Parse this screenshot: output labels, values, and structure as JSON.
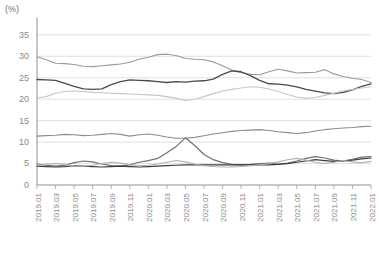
{
  "axis_unit_label": "(%)",
  "chart_data": {
    "type": "line",
    "title": "",
    "subtitle": "",
    "xlabel": "",
    "ylabel": "(%)",
    "ylim": [
      0,
      38
    ],
    "yticks": [
      0,
      5,
      10,
      15,
      20,
      25,
      30,
      35
    ],
    "grid": true,
    "legend_position": "none",
    "annotations": [],
    "x": [
      "2019.01",
      "2019.02",
      "2019.03",
      "2019.04",
      "2019.05",
      "2019.06",
      "2019.07",
      "2019.08",
      "2019.09",
      "2019.10",
      "2019.11",
      "2019.12",
      "2020.01",
      "2020.02",
      "2020.03",
      "2020.04",
      "2020.05",
      "2020.06",
      "2020.07",
      "2020.08",
      "2020.09",
      "2020.10",
      "2020.11",
      "2020.12",
      "2021.01",
      "2021.02",
      "2021.03",
      "2021.04",
      "2021.05",
      "2021.06",
      "2021.07",
      "2021.08",
      "2021.09",
      "2021.10",
      "2021.11",
      "2021.12",
      "2022.01"
    ],
    "tick_labels": [
      "2019.01",
      "2019.03",
      "2019.05",
      "2019.07",
      "2019.09",
      "2019.11",
      "2020.01",
      "2020.03",
      "2020.05",
      "2020.07",
      "2020.09",
      "2020.11",
      "2021.01",
      "2021.03",
      "2021.05",
      "2021.07",
      "2021.09",
      "2021.11",
      "2022.01"
    ],
    "tick_indices": [
      0,
      2,
      4,
      6,
      8,
      10,
      12,
      14,
      16,
      18,
      20,
      22,
      24,
      26,
      28,
      30,
      32,
      34,
      36
    ],
    "series": [
      {
        "name": "series-1",
        "color": "#9a9a9a",
        "width": 1.1,
        "values": [
          29.9,
          29.2,
          28.4,
          28.3,
          28.1,
          27.7,
          27.6,
          27.8,
          28.0,
          28.2,
          28.6,
          29.3,
          29.8,
          30.4,
          30.5,
          30.2,
          29.5,
          29.3,
          29.2,
          28.7,
          27.8,
          26.8,
          26.2,
          25.8,
          25.7,
          26.4,
          27.0,
          26.6,
          26.1,
          26.2,
          26.3,
          26.9,
          25.9,
          25.3,
          24.9,
          24.6,
          23.9
        ]
      },
      {
        "name": "series-2",
        "color": "#4a4a4a",
        "width": 1.3,
        "values": [
          24.6,
          24.5,
          24.4,
          23.7,
          23.0,
          22.4,
          22.3,
          22.4,
          23.4,
          24.1,
          24.5,
          24.4,
          24.3,
          24.1,
          23.9,
          24.1,
          24.0,
          24.2,
          24.3,
          24.7,
          25.8,
          26.6,
          26.4,
          25.5,
          24.4,
          23.6,
          23.5,
          23.3,
          22.9,
          22.3,
          21.9,
          21.5,
          21.3,
          21.6,
          22.2,
          23.0,
          23.6
        ]
      },
      {
        "name": "series-3",
        "color": "#c6c6c6",
        "width": 1.1,
        "values": [
          20.3,
          20.6,
          21.4,
          21.8,
          21.9,
          21.8,
          21.6,
          21.5,
          21.4,
          21.3,
          21.2,
          21.1,
          21.0,
          20.9,
          20.6,
          20.2,
          19.7,
          20.0,
          20.6,
          21.3,
          21.9,
          22.3,
          22.6,
          22.9,
          22.8,
          22.4,
          21.8,
          21.1,
          20.5,
          20.2,
          20.4,
          20.9,
          21.4,
          21.9,
          22.3,
          22.6,
          22.9
        ]
      },
      {
        "name": "series-4",
        "color": "#8c8c8c",
        "width": 1.1,
        "values": [
          11.4,
          11.5,
          11.6,
          11.8,
          11.7,
          11.5,
          11.6,
          11.8,
          12.0,
          11.8,
          11.4,
          11.7,
          11.9,
          11.6,
          11.2,
          10.9,
          10.9,
          11.1,
          11.5,
          11.9,
          12.2,
          12.5,
          12.7,
          12.8,
          12.9,
          12.7,
          12.4,
          12.2,
          12.0,
          12.2,
          12.6,
          12.9,
          13.1,
          13.3,
          13.4,
          13.6,
          13.7
        ]
      },
      {
        "name": "series-5",
        "color": "#707070",
        "width": 1.2,
        "values": [
          4.9,
          4.6,
          4.4,
          4.6,
          5.2,
          5.6,
          5.4,
          4.9,
          4.5,
          4.4,
          4.7,
          5.3,
          5.7,
          6.2,
          7.5,
          9.0,
          11.0,
          9.2,
          7.1,
          5.9,
          5.2,
          4.8,
          4.7,
          4.8,
          5.0,
          5.1,
          4.9,
          5.1,
          5.6,
          6.2,
          6.6,
          6.3,
          5.8,
          5.6,
          6.0,
          6.5,
          6.6
        ]
      },
      {
        "name": "series-6",
        "color": "#3c3c3c",
        "width": 1.2,
        "values": [
          4.4,
          4.3,
          4.2,
          4.3,
          4.5,
          4.4,
          4.3,
          4.2,
          4.3,
          4.4,
          4.3,
          4.2,
          4.3,
          4.4,
          4.5,
          4.6,
          4.7,
          4.7,
          4.7,
          4.7,
          4.7,
          4.7,
          4.7,
          4.7,
          4.7,
          4.7,
          4.8,
          5.0,
          5.3,
          5.6,
          5.9,
          5.7,
          5.5,
          5.6,
          5.8,
          6.1,
          6.3
        ]
      },
      {
        "name": "series-7",
        "color": "#b0b0b0",
        "width": 1.1,
        "values": [
          4.6,
          4.8,
          5.0,
          4.8,
          4.5,
          4.4,
          4.6,
          5.0,
          5.3,
          5.1,
          4.7,
          4.5,
          4.6,
          4.9,
          5.3,
          5.7,
          5.4,
          4.9,
          4.5,
          4.3,
          4.2,
          4.2,
          4.3,
          4.5,
          4.7,
          5.0,
          5.4,
          5.9,
          6.2,
          5.8,
          5.3,
          5.0,
          5.3,
          5.7,
          5.4,
          5.2,
          5.5
        ]
      }
    ]
  }
}
